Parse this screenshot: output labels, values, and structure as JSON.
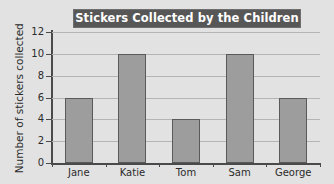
{
  "chart_data": {
    "type": "bar",
    "title": "Stickers Collected by the Children",
    "xlabel": "",
    "ylabel": "Number of stickers collected",
    "categories": [
      "Jane",
      "Katie",
      "Tom",
      "Sam",
      "George"
    ],
    "values": [
      6,
      10,
      4,
      10,
      6
    ],
    "ylim": [
      0,
      12
    ],
    "ytick_labels": [
      "12",
      "10",
      "8",
      "6",
      "4",
      "2",
      "0"
    ],
    "ytick_values": [
      12,
      10,
      8,
      6,
      4,
      2,
      0
    ],
    "ytick_step": 2,
    "grid": true,
    "grid_axis": "y",
    "legend": false,
    "series": [
      {
        "name": "Stickers collected",
        "values": [
          6,
          10,
          4,
          10,
          6
        ]
      }
    ],
    "colors": {
      "background": "#e2e2e2",
      "title_banner": "#575757",
      "title_text": "#ffffff",
      "bar_fill": "#9d9d9d",
      "bar_outline": "#5a5a5a",
      "gridline": "#b4b4b4",
      "axis": "#4a4a4a",
      "tick_text": "#2b2b2b"
    }
  }
}
